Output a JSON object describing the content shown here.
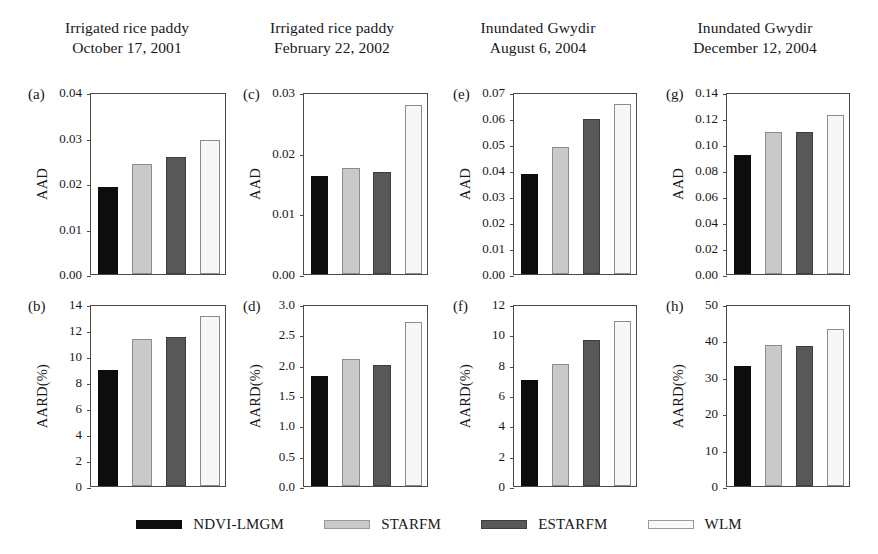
{
  "figure": {
    "column_titles": [
      {
        "line1": "Irrigated rice paddy",
        "line2": "October 17, 2001"
      },
      {
        "line1": "Irrigated rice paddy",
        "line2": "February 22, 2002"
      },
      {
        "line1": "Inundated Gwydir",
        "line2": "August 6, 2004"
      },
      {
        "line1": "Inundated Gwydir",
        "line2": "December 12, 2004"
      }
    ]
  },
  "legend": {
    "position": "bottom-center",
    "entries": [
      {
        "label": "NDVI-LMGM",
        "color": "#0d0d0d"
      },
      {
        "label": "STARFM",
        "color": "#c9c9c9"
      },
      {
        "label": "ESTARFM",
        "color": "#585858"
      },
      {
        "label": "WLM",
        "color": "#f7f7f5"
      }
    ]
  },
  "chart_data": [
    {
      "type": "bar",
      "panel": "(a)",
      "title": "Irrigated rice paddy October 17, 2001",
      "xlabel": "",
      "ylabel": "AAD",
      "categories": [
        "NDVI-LMGM",
        "STARFM",
        "ESTARFM",
        "WLM"
      ],
      "values": [
        0.0192,
        0.0242,
        0.0257,
        0.0295
      ],
      "ylim": [
        0.0,
        0.04
      ],
      "yticks": [
        0.0,
        0.01,
        0.02,
        0.03,
        0.04
      ],
      "ytick_labels": [
        "0.00",
        "0.01",
        "0.02",
        "0.03",
        "0.04"
      ],
      "grid": false
    },
    {
      "type": "bar",
      "panel": "(c)",
      "title": "Irrigated rice paddy February 22, 2002",
      "xlabel": "",
      "ylabel": "AAD",
      "categories": [
        "NDVI-LMGM",
        "STARFM",
        "ESTARFM",
        "WLM"
      ],
      "values": [
        0.0161,
        0.0175,
        0.0168,
        0.0278
      ],
      "ylim": [
        0.0,
        0.03
      ],
      "yticks": [
        0.0,
        0.01,
        0.02,
        0.03
      ],
      "ytick_labels": [
        "0.00",
        "0.01",
        "0.02",
        "0.03"
      ],
      "grid": false
    },
    {
      "type": "bar",
      "panel": "(e)",
      "title": "Inundated Gwydir August 6, 2004",
      "xlabel": "",
      "ylabel": "AAD",
      "categories": [
        "NDVI-LMGM",
        "STARFM",
        "ESTARFM",
        "WLM"
      ],
      "values": [
        0.0385,
        0.0487,
        0.0596,
        0.0652
      ],
      "ylim": [
        0.0,
        0.07
      ],
      "yticks": [
        0.0,
        0.01,
        0.02,
        0.03,
        0.04,
        0.05,
        0.06,
        0.07
      ],
      "ytick_labels": [
        "0.00",
        "0.01",
        "0.02",
        "0.03",
        "0.04",
        "0.05",
        "0.06",
        "0.07"
      ],
      "grid": false
    },
    {
      "type": "bar",
      "panel": "(g)",
      "title": "Inundated Gwydir December 12, 2004",
      "xlabel": "",
      "ylabel": "AAD",
      "categories": [
        "NDVI-LMGM",
        "STARFM",
        "ESTARFM",
        "WLM"
      ],
      "values": [
        0.0912,
        0.1093,
        0.1093,
        0.1222
      ],
      "ylim": [
        0.0,
        0.14
      ],
      "yticks": [
        0.0,
        0.02,
        0.04,
        0.06,
        0.08,
        0.1,
        0.12,
        0.14
      ],
      "ytick_labels": [
        "0.00",
        "0.02",
        "0.04",
        "0.06",
        "0.08",
        "0.10",
        "0.12",
        "0.14"
      ],
      "grid": false
    },
    {
      "type": "bar",
      "panel": "(b)",
      "title": "Irrigated rice paddy October 17, 2001",
      "xlabel": "",
      "ylabel": "AARD(%)",
      "categories": [
        "NDVI-LMGM",
        "STARFM",
        "ESTARFM",
        "WLM"
      ],
      "values": [
        8.9,
        11.3,
        11.45,
        13.05
      ],
      "ylim": [
        0,
        14
      ],
      "yticks": [
        0,
        2,
        4,
        6,
        8,
        10,
        12,
        14
      ],
      "ytick_labels": [
        "0",
        "2",
        "4",
        "6",
        "8",
        "10",
        "12",
        "14"
      ],
      "grid": false
    },
    {
      "type": "bar",
      "panel": "(d)",
      "title": "Irrigated rice paddy February 22, 2002",
      "xlabel": "",
      "ylabel": "AARD(%)",
      "categories": [
        "NDVI-LMGM",
        "STARFM",
        "ESTARFM",
        "WLM"
      ],
      "values": [
        1.82,
        2.09,
        2.0,
        2.71
      ],
      "ylim": [
        0.0,
        3.0
      ],
      "yticks": [
        0.0,
        0.5,
        1.0,
        1.5,
        2.0,
        2.5,
        3.0
      ],
      "ytick_labels": [
        "0.0",
        "0.5",
        "1.0",
        "1.5",
        "2.0",
        "2.5",
        "3.0"
      ],
      "grid": false
    },
    {
      "type": "bar",
      "panel": "(f)",
      "title": "Inundated Gwydir August 6, 2004",
      "xlabel": "",
      "ylabel": "AARD(%)",
      "categories": [
        "NDVI-LMGM",
        "STARFM",
        "ESTARFM",
        "WLM"
      ],
      "values": [
        7.0,
        8.05,
        9.65,
        10.9
      ],
      "ylim": [
        0,
        12
      ],
      "yticks": [
        0,
        2,
        4,
        6,
        8,
        10,
        12
      ],
      "ytick_labels": [
        "0",
        "2",
        "4",
        "6",
        "8",
        "10",
        "12"
      ],
      "grid": false
    },
    {
      "type": "bar",
      "panel": "(h)",
      "title": "Inundated Gwydir December 12, 2004",
      "xlabel": "",
      "ylabel": "AARD(%)",
      "categories": [
        "NDVI-LMGM",
        "STARFM",
        "ESTARFM",
        "WLM"
      ],
      "values": [
        32.9,
        38.8,
        38.5,
        43.0
      ],
      "ylim": [
        0,
        50
      ],
      "yticks": [
        0,
        10,
        20,
        30,
        40,
        50
      ],
      "ytick_labels": [
        "0",
        "10",
        "20",
        "30",
        "40",
        "50"
      ],
      "grid": false
    }
  ]
}
